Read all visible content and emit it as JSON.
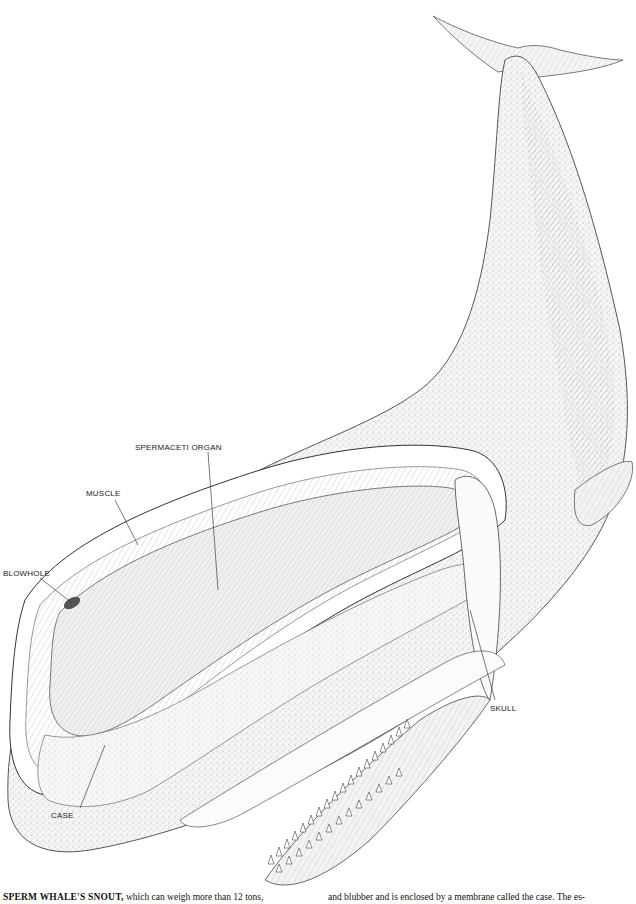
{
  "figure": {
    "labels": [
      {
        "id": "spermaceti-organ",
        "text": "SPERMACETI ORGAN",
        "x": 135,
        "y": 444
      },
      {
        "id": "muscle",
        "text": "MUSCLE",
        "x": 86,
        "y": 490
      },
      {
        "id": "blowhole",
        "text": "BLOWHOLE",
        "x": 3,
        "y": 570
      },
      {
        "id": "case",
        "text": "CASE",
        "x": 51,
        "y": 812
      },
      {
        "id": "skull",
        "text": "SKULL",
        "x": 490,
        "y": 705
      }
    ],
    "caption": {
      "left_lead": "SPERM WHALE'S SNOUT,",
      "left_rest": " which can weigh more than 12 tons,",
      "right": "and blubber and is enclosed by a membrane called the case. The es-"
    }
  }
}
